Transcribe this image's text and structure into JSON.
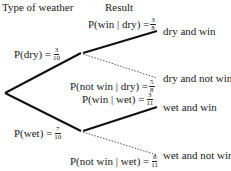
{
  "headers": {
    "type_of_weather": "Type of weather",
    "result": "Result"
  },
  "branches": {
    "dry": {
      "label": "P(dry) =",
      "num": "3",
      "den": "10"
    },
    "wet": {
      "label": "P(wet) =",
      "num": "7",
      "den": "10"
    },
    "win_given_dry": {
      "label": "P(win | dry) =",
      "num": "3",
      "den": "8"
    },
    "notwin_given_dry": {
      "label": "P(not win | dry) =",
      "num": "5",
      "den": "8"
    },
    "win_given_wet": {
      "label": "P(win | wet) =",
      "num": "3",
      "den": "11"
    },
    "notwin_given_wet": {
      "label": "P(not win | wet) =",
      "num": "8",
      "den": "11"
    }
  },
  "outcomes": {
    "dry_win": "dry and win",
    "dry_notwin": "dry and not win",
    "wet_win": "wet and win",
    "wet_notwin": "wet and not win"
  },
  "colors": {
    "line": "#111111",
    "text": "#222222",
    "dotted": "#555555"
  }
}
